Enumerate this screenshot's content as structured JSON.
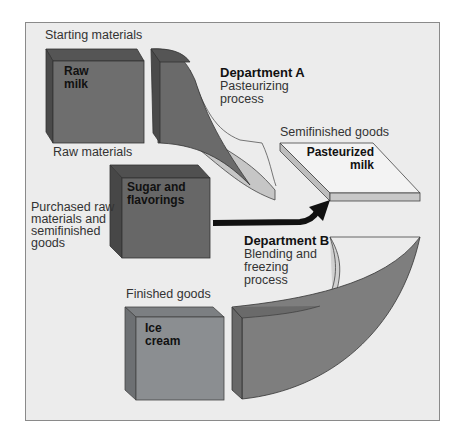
{
  "diagram": {
    "type": "process-flow",
    "colors": {
      "background": "#ececec",
      "frame_border": "#8a8a8a",
      "raw_milk_front": "#6d6d6d",
      "raw_milk_top": "#555555",
      "raw_milk_side": "#4c4c4c",
      "sugar_front": "#666666",
      "ice_cream_front": "#8a8d8f",
      "pasteurized_top": "#f3f3f3",
      "pasteurized_edge": "#c4c4c4",
      "arrow": "#111111"
    }
  },
  "labels": {
    "starting_materials": "Starting materials",
    "raw_materials": "Raw  materials",
    "purchased": "Purchased raw\nmaterials and\nsemifinished\ngoods",
    "semifinished_goods": "Semifinished goods",
    "finished_goods": "Finished  goods"
  },
  "boxes": {
    "raw_milk": "Raw\nmilk",
    "sugar": "Sugar and\nflavorings",
    "pasteurized": "Pasteurized\nmilk",
    "ice_cream": "Ice\ncream"
  },
  "departments": {
    "a": {
      "title": "Department A",
      "process": "Pasteurizing\nprocess"
    },
    "b": {
      "title": "Department B",
      "process": "Blending and\nfreezing\nprocess"
    }
  }
}
